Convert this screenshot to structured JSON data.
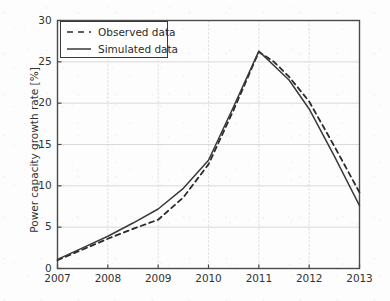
{
  "chart_data": {
    "type": "line",
    "title": "",
    "xlabel": "",
    "ylabel": "Power capacity growth rate [%]",
    "xlim": [
      2007,
      2013
    ],
    "ylim": [
      0,
      30
    ],
    "grid": true,
    "legend_position": "upper left",
    "xticks": [
      2007,
      2008,
      2009,
      2010,
      2011,
      2012,
      2013
    ],
    "xtick_labels": [
      "2007",
      "2008",
      "2009",
      "2010",
      "2011",
      "2012",
      "2013"
    ],
    "yticks": [
      0,
      5,
      10,
      15,
      20,
      25,
      30
    ],
    "ytick_labels": [
      "0",
      "5",
      "10",
      "15",
      "20",
      "25",
      "30"
    ],
    "x": [
      2007,
      2008,
      2009,
      2010,
      2011,
      2012,
      2013
    ],
    "series": [
      {
        "name": "Observed data",
        "style": "dashed",
        "color": "#2b2b2b",
        "x": [
          2007.0,
          2007.5,
          2008.0,
          2008.5,
          2009.0,
          2009.5,
          2010.0,
          2010.5,
          2011.0,
          2011.3,
          2011.6,
          2012.0,
          2012.5,
          2013.0
        ],
        "values": [
          1.0,
          2.3,
          3.6,
          4.8,
          5.9,
          8.6,
          12.6,
          19.2,
          26.2,
          25.0,
          23.2,
          20.2,
          14.8,
          9.2
        ]
      },
      {
        "name": "Simulated data",
        "style": "solid",
        "color": "#3a3a3a",
        "x": [
          2007.0,
          2007.5,
          2008.0,
          2008.5,
          2009.0,
          2009.5,
          2010.0,
          2010.5,
          2011.0,
          2011.6,
          2012.0,
          2012.5,
          2013.0
        ],
        "values": [
          1.1,
          2.5,
          3.9,
          5.5,
          7.2,
          9.7,
          13.1,
          19.6,
          26.3,
          22.8,
          19.3,
          13.6,
          7.6
        ]
      }
    ]
  },
  "legend": {
    "items": [
      {
        "label": "Observed data",
        "style": "dashed"
      },
      {
        "label": "Simulated data",
        "style": "solid"
      }
    ]
  },
  "axes": {
    "ylabel": "Power capacity growth rate [%]"
  }
}
